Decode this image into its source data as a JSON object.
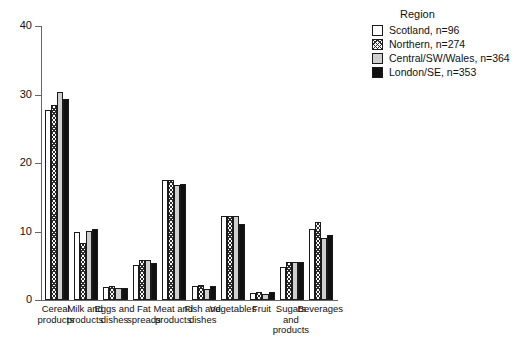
{
  "chart_data": {
    "type": "bar",
    "title": "",
    "xlabel": "",
    "ylabel": "",
    "ylim": [
      0,
      40
    ],
    "yticks": [
      0,
      10,
      20,
      30,
      40
    ],
    "grid": false,
    "legend_position": "top-right",
    "legend_title": "Region",
    "categories": [
      "Cereal products",
      "Milk and products",
      "Eggs and dishes",
      "Fat spreads",
      "Meat and products",
      "Fish and dishes",
      "Vegetables",
      "Fruit",
      "Sugars and products",
      "Beverages"
    ],
    "series": [
      {
        "name": "Scotland, n=96",
        "key": "scotland",
        "swatch": "white",
        "values": [
          27.8,
          9.9,
          1.9,
          5.1,
          17.5,
          2.1,
          12.2,
          1.0,
          4.8,
          10.4
        ]
      },
      {
        "name": "Northern, n=274",
        "key": "northern",
        "swatch": "hatched",
        "values": [
          28.4,
          8.3,
          2.0,
          5.9,
          17.5,
          2.2,
          12.3,
          1.1,
          5.5,
          11.4
        ]
      },
      {
        "name": "Central/SW/Wales, n=364",
        "key": "central",
        "swatch": "light-gray",
        "values": [
          30.3,
          10.1,
          1.8,
          5.9,
          16.8,
          1.6,
          12.2,
          0.9,
          5.6,
          9.1
        ]
      },
      {
        "name": "London/SE, n=353",
        "key": "london",
        "swatch": "black",
        "values": [
          29.4,
          10.4,
          1.8,
          5.4,
          17.0,
          2.1,
          11.1,
          1.1,
          5.5,
          9.5
        ]
      }
    ]
  },
  "legend": {
    "title": "Region",
    "items": [
      {
        "label": "Scotland, n=96"
      },
      {
        "label": "Northern, n=274"
      },
      {
        "label": "Central/SW/Wales, n=364"
      },
      {
        "label": "London/SE, n=353"
      }
    ]
  },
  "axis": {
    "y_labels": [
      "40",
      "30",
      "20",
      "10",
      "0"
    ]
  },
  "colors": {
    "axis": "#666666",
    "outline": "#1a1a1a",
    "scotland": "#ffffff",
    "central": "#cfcfcf",
    "london": "#101010"
  }
}
